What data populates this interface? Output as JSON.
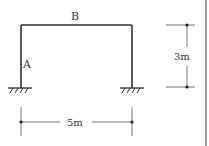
{
  "diagram": {
    "type": "portal-frame",
    "labels": {
      "top_beam": "B",
      "left_column": "A"
    },
    "dimensions": {
      "height": "3m",
      "span": "5m"
    },
    "supports": [
      "fixed",
      "fixed"
    ],
    "colors": {
      "line": "#333333",
      "dim_line": "#555555",
      "border": "#555555"
    }
  }
}
